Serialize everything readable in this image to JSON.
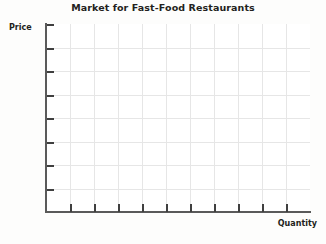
{
  "chart_data": {
    "type": "line",
    "title": "Market for Fast-Food Restaurants",
    "xlabel": "Quantity",
    "ylabel": "Price",
    "series": [],
    "x": [],
    "values": [],
    "grid": true,
    "grid_columns": 11,
    "grid_rows": 8,
    "x_tick_count": 11,
    "y_tick_count": 8,
    "xtick_labels": [],
    "ytick_labels": [],
    "legend": null,
    "legend_position": "none",
    "annotations": [],
    "note": "Empty blank graph grid with no plotted data, for drawing supply and demand curves"
  },
  "chart": {
    "title": "Market for Fast-Food Restaurants",
    "y_axis_label": "Price",
    "x_axis_label": "Quantity"
  },
  "colors": {
    "axis": "#5a5a5a",
    "tick": "#3f3f3f",
    "grid": "#e6e6e6",
    "text": "#231f20",
    "plot_background": "#ffffff",
    "page_background": "#fdfdfc"
  }
}
